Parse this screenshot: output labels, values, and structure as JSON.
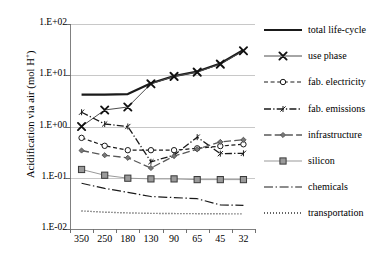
{
  "chart_data": {
    "type": "line",
    "title": "",
    "xlabel": "",
    "ylabel": "Acidification via air  (mol H+)",
    "ylabel_html": "Acidification via air  (mol H<sup>+</sup>)",
    "categories": [
      "350",
      "250",
      "180",
      "130",
      "90",
      "65",
      "45",
      "32"
    ],
    "yscale": "log",
    "ylim": [
      0.01,
      100
    ],
    "ytick_labels": [
      "1.E+02",
      "1.E+01",
      "1.E+00",
      "1.E-01",
      "1.E-02"
    ],
    "ytick_values": [
      100,
      10,
      1,
      0.1,
      0.01
    ],
    "grid": true,
    "legend_position": "right",
    "series": [
      {
        "name": "total life-cycle",
        "values": [
          4.2,
          4.2,
          4.3,
          7.0,
          9.6,
          11.8,
          17.0,
          31.0
        ],
        "color": "#1a1a1a",
        "width": 2.2,
        "dash": "none",
        "marker": "none"
      },
      {
        "name": "use phase",
        "values": [
          1.0,
          2.1,
          2.4,
          6.8,
          9.5,
          11.5,
          16.5,
          30.0
        ],
        "color": "#4d4d4d",
        "width": 1.0,
        "dash": "none",
        "marker": "x"
      },
      {
        "name": "fab. electricity",
        "values": [
          0.6,
          0.42,
          0.345,
          0.345,
          0.345,
          0.375,
          0.415,
          0.45
        ],
        "color": "#1a1a1a",
        "width": 1.2,
        "dash": "dashed",
        "marker": "circle"
      },
      {
        "name": "fab. emissions",
        "values": [
          1.9,
          1.12,
          1.0,
          0.205,
          0.275,
          0.62,
          0.295,
          0.3
        ],
        "color": "#1a1a1a",
        "width": 1.3,
        "dash": "dashdot",
        "marker": "tick"
      },
      {
        "name": "infrastructure",
        "values": [
          0.34,
          0.275,
          0.245,
          0.155,
          0.265,
          0.36,
          0.5,
          0.55
        ],
        "color": "#595959",
        "width": 1.3,
        "dash": "longdash",
        "marker": "diamond"
      },
      {
        "name": "silicon",
        "values": [
          0.145,
          0.112,
          0.098,
          0.095,
          0.095,
          0.092,
          0.092,
          0.092
        ],
        "color": "#999999",
        "width": 1.0,
        "dash": "none",
        "marker": "square"
      },
      {
        "name": "chemicals",
        "values": [
          0.078,
          0.062,
          0.052,
          0.043,
          0.041,
          0.039,
          0.0295,
          0.029
        ],
        "color": "#1a1a1a",
        "width": 1.2,
        "dash": "dashdotlong",
        "marker": "none"
      },
      {
        "name": "transportation",
        "values": [
          0.0225,
          0.0213,
          0.0206,
          0.0202,
          0.02,
          0.0199,
          0.0198,
          0.0197
        ],
        "color": "#1a1a1a",
        "width": 1.4,
        "dash": "dotted",
        "marker": "none"
      }
    ]
  },
  "legend": {
    "items": [
      {
        "label": "total life-cycle"
      },
      {
        "label": "use phase"
      },
      {
        "label": "fab. electricity"
      },
      {
        "label": "fab. emissions"
      },
      {
        "label": "infrastructure"
      },
      {
        "label": "silicon"
      },
      {
        "label": "chemicals"
      },
      {
        "label": "transportation"
      }
    ]
  }
}
